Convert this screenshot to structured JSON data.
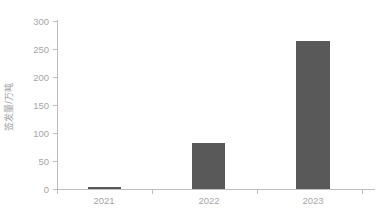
{
  "chart_data": {
    "type": "bar",
    "title": "",
    "subtitle": "",
    "xlabel": "",
    "ylabel": "签发量/万吨",
    "categories": [
      "2021",
      "2022",
      "2023"
    ],
    "values": [
      3,
      82,
      265
    ],
    "series": [
      {
        "name": "签发量",
        "values": [
          3,
          82,
          265
        ]
      }
    ],
    "ylim": [
      0,
      300
    ],
    "yticks": [
      0,
      50,
      100,
      150,
      200,
      250,
      300
    ],
    "ytick_labels": [
      "0",
      "50",
      "100",
      "150",
      "200",
      "250",
      "300"
    ],
    "xtick_labels": [
      "2021",
      "2022",
      "2023"
    ],
    "grid": false,
    "legend": false,
    "legend_position": "none",
    "bar_color": "#595959",
    "axis_color": "#bdbdbd",
    "tick_label_color": "#a6a6a6",
    "axis_label_color": "#9e9e9e",
    "background_color": "#ffffff"
  }
}
